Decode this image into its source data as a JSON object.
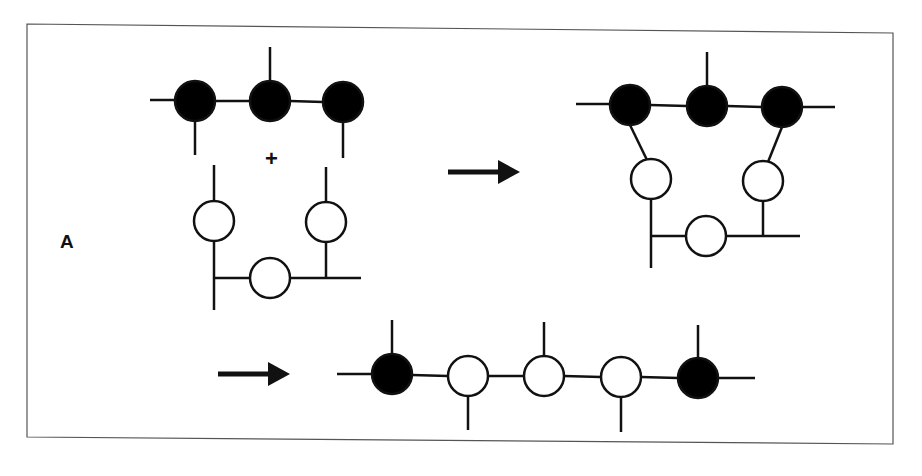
{
  "figure": {
    "panel_label": "A",
    "operator_plus": "+",
    "colors": {
      "stroke": "#111111",
      "filled_node": "#000000",
      "open_node": "#ffffff",
      "frame": "#555555",
      "background": "#ffffff"
    },
    "node_radius": 20,
    "stroke_width": 2.5,
    "frame": {
      "points": "27,24 893,33 893,444 27,437"
    },
    "groups": [
      {
        "name": "reactant-black-chain",
        "nodes": [
          {
            "cx": 195,
            "cy": 101,
            "type": "filled"
          },
          {
            "cx": 270,
            "cy": 101,
            "type": "filled"
          },
          {
            "cx": 343,
            "cy": 102,
            "type": "filled"
          }
        ],
        "lines": [
          [
            150,
            100,
            175,
            100
          ],
          [
            215,
            101,
            250,
            101
          ],
          [
            290,
            101,
            323,
            102
          ],
          [
            270,
            47,
            270,
            81
          ],
          [
            195,
            121,
            195,
            155
          ],
          [
            343,
            122,
            343,
            158
          ]
        ]
      },
      {
        "name": "reactant-white-loop",
        "nodes": [
          {
            "cx": 214,
            "cy": 221,
            "type": "open"
          },
          {
            "cx": 326,
            "cy": 222,
            "type": "open"
          },
          {
            "cx": 270,
            "cy": 278,
            "type": "open"
          }
        ],
        "lines": [
          [
            214,
            165,
            214,
            201
          ],
          [
            326,
            167,
            326,
            202
          ],
          [
            214,
            241,
            214,
            310
          ],
          [
            214,
            278,
            250,
            278
          ],
          [
            290,
            278,
            361,
            278
          ],
          [
            326,
            242,
            326,
            278
          ]
        ]
      },
      {
        "name": "intermediate-complex",
        "nodes": [
          {
            "cx": 630,
            "cy": 105,
            "type": "filled"
          },
          {
            "cx": 707,
            "cy": 106,
            "type": "filled"
          },
          {
            "cx": 782,
            "cy": 107,
            "type": "filled"
          },
          {
            "cx": 651,
            "cy": 179,
            "type": "open"
          },
          {
            "cx": 763,
            "cy": 181,
            "type": "open"
          },
          {
            "cx": 706,
            "cy": 236,
            "type": "open"
          }
        ],
        "lines": [
          [
            576,
            104,
            610,
            104
          ],
          [
            650,
            105,
            687,
            106
          ],
          [
            727,
            106,
            762,
            107
          ],
          [
            802,
            107,
            835,
            107
          ],
          [
            707,
            52,
            707,
            86
          ],
          [
            630,
            125,
            647,
            160
          ],
          [
            782,
            127,
            768,
            162
          ],
          [
            651,
            199,
            651,
            268
          ],
          [
            651,
            236,
            686,
            236
          ],
          [
            726,
            236,
            800,
            236
          ],
          [
            763,
            201,
            763,
            236
          ]
        ]
      },
      {
        "name": "product-chain",
        "nodes": [
          {
            "cx": 392,
            "cy": 374,
            "type": "filled"
          },
          {
            "cx": 468,
            "cy": 376,
            "type": "open"
          },
          {
            "cx": 544,
            "cy": 376,
            "type": "open"
          },
          {
            "cx": 621,
            "cy": 377,
            "type": "open"
          },
          {
            "cx": 698,
            "cy": 378,
            "type": "filled"
          }
        ],
        "lines": [
          [
            337,
            374,
            372,
            374
          ],
          [
            412,
            375,
            448,
            376
          ],
          [
            488,
            376,
            524,
            376
          ],
          [
            564,
            376,
            601,
            377
          ],
          [
            641,
            377,
            678,
            378
          ],
          [
            718,
            378,
            755,
            378
          ],
          [
            392,
            320,
            392,
            354
          ],
          [
            544,
            322,
            544,
            356
          ],
          [
            698,
            325,
            698,
            358
          ],
          [
            468,
            396,
            468,
            430
          ],
          [
            621,
            397,
            621,
            432
          ]
        ]
      }
    ],
    "arrows": [
      {
        "name": "arrow-reactants-to-intermediate",
        "x1": 448,
        "y1": 172,
        "x2": 520,
        "y2": 172
      },
      {
        "name": "arrow-intermediate-to-product",
        "x1": 218,
        "y1": 374,
        "x2": 290,
        "y2": 374
      }
    ],
    "label_pos": {
      "left": 60,
      "top": 231
    },
    "plus_pos": {
      "left": 265,
      "top": 148
    }
  }
}
